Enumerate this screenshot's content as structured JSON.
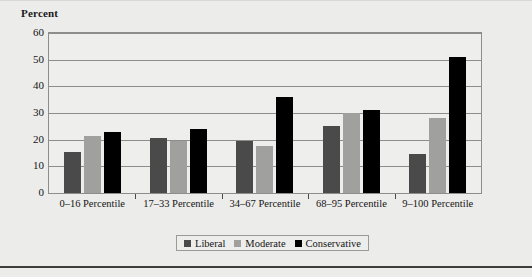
{
  "chart_data": {
    "type": "bar",
    "title": "",
    "ylabel": "Percent",
    "xlabel": "",
    "categories": [
      "0–16 Percentile",
      "17–33 Percentile",
      "34–67 Percentile",
      "68–95 Percentile",
      "9–100 Percentile"
    ],
    "series": [
      {
        "name": "Liberal",
        "color": "#4a4a4a",
        "values": [
          15.5,
          20.5,
          19.5,
          25.0,
          14.5
        ]
      },
      {
        "name": "Moderate",
        "color": "#a0a09e",
        "values": [
          21.5,
          19.5,
          17.5,
          30.0,
          28.0
        ]
      },
      {
        "name": "Conservative",
        "color": "#000000",
        "values": [
          23.0,
          24.0,
          36.0,
          31.0,
          51.0
        ]
      }
    ],
    "ylim": [
      0,
      60
    ],
    "yticks": [
      0,
      10,
      20,
      30,
      40,
      50,
      60
    ],
    "ytick_labels": [
      "0",
      "10",
      "20",
      "30",
      "40",
      "50",
      "60"
    ],
    "grid": true,
    "legend_position": "bottom-center"
  }
}
